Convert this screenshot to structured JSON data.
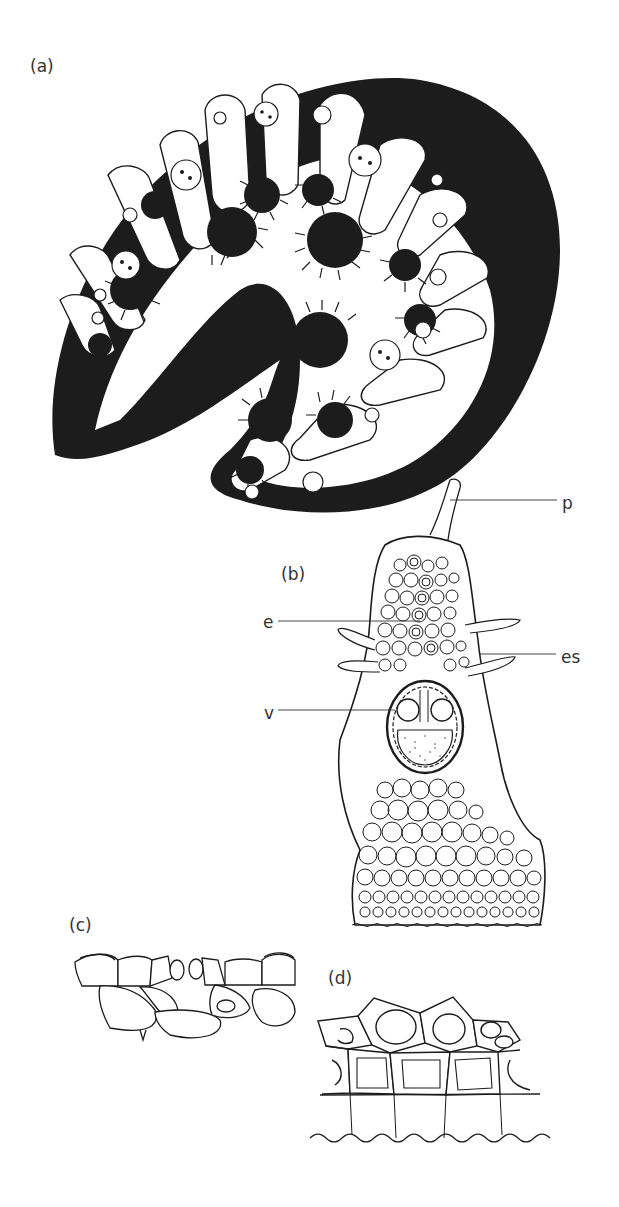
{
  "figure": {
    "panels": [
      {
        "id": "a",
        "label": "(a)",
        "description": "Transverse section of rolled leaf, dark tissue with deep furrows lined with hairs and stomatal crypts"
      },
      {
        "id": "b",
        "label": "(b)",
        "description": "Detail of a leaf rib in cross section with vascular bundle"
      },
      {
        "id": "c",
        "label": "(c)",
        "description": "Epidermis with stoma"
      },
      {
        "id": "d",
        "label": "(d)",
        "description": "Outer epidermis with thick-walled cells"
      }
    ],
    "annotations": [
      {
        "id": "p",
        "label": "p",
        "panel": "b"
      },
      {
        "id": "e",
        "label": "e",
        "panel": "b"
      },
      {
        "id": "es",
        "label": "es",
        "panel": "b"
      },
      {
        "id": "v",
        "label": "v",
        "panel": "b"
      }
    ],
    "colors": {
      "ink": "#1c1c1c",
      "background": "#ffffff",
      "label": "#333333"
    }
  }
}
